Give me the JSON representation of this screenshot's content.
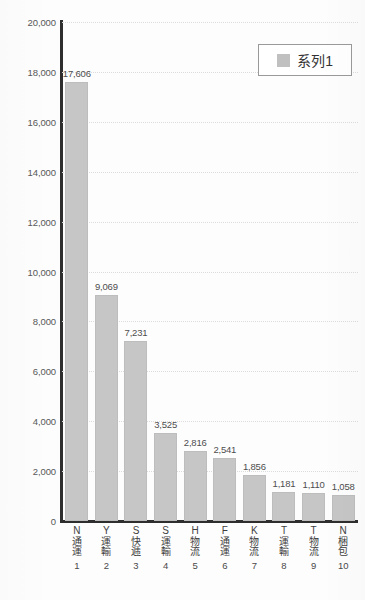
{
  "chart_data": {
    "type": "bar",
    "title": "",
    "subtitle": "",
    "xlabel": "",
    "ylabel": "",
    "ylim": [
      0,
      20000
    ],
    "y_ticks": [
      "0",
      "2,000",
      "4,000",
      "6,000",
      "8,000",
      "10,000",
      "12,000",
      "14,000",
      "16,000",
      "18,000",
      "20,000"
    ],
    "y_tick_values": [
      0,
      2000,
      4000,
      6000,
      8000,
      10000,
      12000,
      14000,
      16000,
      18000,
      20000
    ],
    "grid": true,
    "grid_style": "dotted-horizontal",
    "legend_position": "top-right",
    "bar_color": "#c6c6c6",
    "axis_color": "#2e2e2e",
    "categories": [
      "N通運",
      "Y運輸",
      "S快逓",
      "S運輸",
      "H物流",
      "F通運",
      "K物流",
      "T運輸",
      "T物流",
      "N梱包"
    ],
    "category_codes": [
      "N",
      "Y",
      "S",
      "S",
      "H",
      "F",
      "K",
      "T",
      "T",
      "N"
    ],
    "category_jp": [
      "通運",
      "運輸",
      "快逓",
      "運輸",
      "物流",
      "通運",
      "物流",
      "運輸",
      "物流",
      "梱包"
    ],
    "category_indexes": [
      "1",
      "2",
      "3",
      "4",
      "5",
      "6",
      "7",
      "8",
      "9",
      "10"
    ],
    "values": [
      17606,
      9069,
      7231,
      3525,
      2816,
      2541,
      1856,
      1181,
      1110,
      1058
    ],
    "value_labels": [
      "17,606",
      "9,069",
      "7,231",
      "3,525",
      "2,816",
      "2,541",
      "1,856",
      "1,181",
      "1,110",
      "1,058"
    ],
    "series": [
      {
        "name": "系列1",
        "values": [
          17606,
          9069,
          7231,
          3525,
          2816,
          2541,
          1856,
          1181,
          1110,
          1058
        ]
      }
    ]
  },
  "legend": {
    "label": "系列1",
    "swatch_color": "#c0c0c0"
  }
}
